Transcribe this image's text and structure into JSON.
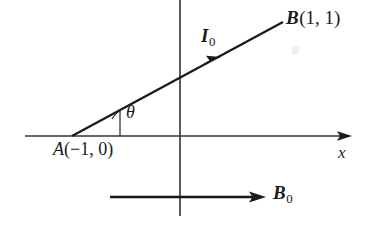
{
  "figure": {
    "background_color": "#ffffff",
    "ink_color": "#1a1a1a"
  },
  "axes": {
    "x_axis_label": "x",
    "x_axis": {
      "x1": 25,
      "y1": 136,
      "x2": 352,
      "y2": 136,
      "arrow": "right"
    },
    "y_axis": {
      "x1": 180,
      "y1": 0,
      "x2": 180,
      "y2": 216,
      "arrow": "none"
    },
    "origin": {
      "x": 180,
      "y": 136
    }
  },
  "points": {
    "A": {
      "point_label": "A",
      "coordinates_text": "(−1, 0)",
      "full_label": "A(−1, 0)",
      "x": 72,
      "y": 136
    },
    "B": {
      "point_label": "B",
      "coordinates_text": "(1, 1)",
      "full_label": "B(1, 1)",
      "x": 283,
      "y": 22,
      "bold": true
    }
  },
  "current_vector": {
    "label": "I",
    "subscript": "0",
    "full_label": "I₀",
    "from": {
      "x": 72,
      "y": 136
    },
    "to": {
      "x": 283,
      "y": 22
    },
    "arrow_at": {
      "x": 216,
      "y": 60
    },
    "arrow_direction": "up-right"
  },
  "field_vector": {
    "label": "B",
    "subscript": "0",
    "full_label": "B₀",
    "from": {
      "x": 110,
      "y": 197
    },
    "to": {
      "x": 266,
      "y": 197
    },
    "arrow_direction": "right",
    "bold": true
  },
  "angle": {
    "symbol": "θ",
    "vertex": {
      "x": 72,
      "y": 136
    },
    "tick_line": {
      "x": 120,
      "y_top": 110,
      "y_bottom": 136
    },
    "between": [
      "current_vector",
      "x_axis"
    ]
  }
}
